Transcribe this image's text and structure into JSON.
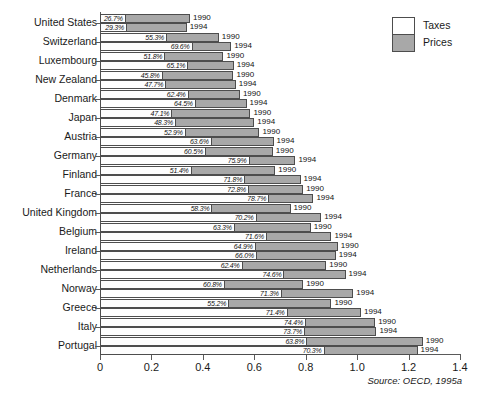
{
  "chart_data": {
    "type": "bar",
    "orientation": "horizontal",
    "stacked": true,
    "title": "",
    "subtitle": "",
    "xlabel": "",
    "ylabel": "",
    "xlim": [
      0,
      1.4
    ],
    "xticks": [
      "0",
      "0.2",
      "0.4",
      "0.6",
      "0.8",
      "1.0",
      "1.2",
      "1.4"
    ],
    "xtick_values": [
      0,
      0.2,
      0.4,
      0.6,
      0.8,
      1.0,
      1.2,
      1.4
    ],
    "grid": false,
    "legend_position": "top-right",
    "legend": [
      {
        "label": "Taxes",
        "color": "#ffffff"
      },
      {
        "label": "Prices",
        "color": "#a8a8a8"
      }
    ],
    "categories": [
      "United States",
      "Switzerland",
      "Luxembourg",
      "New Zealand",
      "Denmark",
      "Japan",
      "Austria",
      "Germany",
      "Finland",
      "France",
      "United Kingdom",
      "Belgium",
      "Ireland",
      "Netherlands",
      "Norway",
      "Greece",
      "Italy",
      "Portugal"
    ],
    "source": "Source: OECD, 1995a",
    "source_prefix": "Source:",
    "source_rest": " OECD, 1995a",
    "bars": [
      {
        "country": "United States",
        "year": "1990",
        "total": 0.35,
        "tax_share_pct": "26.7%",
        "tax_share": 0.267
      },
      {
        "country": "United States",
        "year": "1994",
        "total": 0.337,
        "tax_share_pct": "29.3%",
        "tax_share": 0.293
      },
      {
        "country": "Switzerland",
        "year": "1990",
        "total": 0.462,
        "tax_share_pct": "55.3%",
        "tax_share": 0.553
      },
      {
        "country": "Switzerland",
        "year": "1994",
        "total": 0.51,
        "tax_share_pct": "69.6%",
        "tax_share": 0.696
      },
      {
        "country": "Luxembourg",
        "year": "1990",
        "total": 0.48,
        "tax_share_pct": "51.8%",
        "tax_share": 0.518
      },
      {
        "country": "Luxembourg",
        "year": "1994",
        "total": 0.52,
        "tax_share_pct": "65.1%",
        "tax_share": 0.651
      },
      {
        "country": "New Zealand",
        "year": "1990",
        "total": 0.519,
        "tax_share_pct": "45.8%",
        "tax_share": 0.458
      },
      {
        "country": "New Zealand",
        "year": "1994",
        "total": 0.528,
        "tax_share_pct": "47.7%",
        "tax_share": 0.477
      },
      {
        "country": "Denmark",
        "year": "1990",
        "total": 0.544,
        "tax_share_pct": "62.4%",
        "tax_share": 0.624
      },
      {
        "country": "Denmark",
        "year": "1994",
        "total": 0.57,
        "tax_share_pct": "64.5%",
        "tax_share": 0.645
      },
      {
        "country": "Japan",
        "year": "1990",
        "total": 0.585,
        "tax_share_pct": "47.1%",
        "tax_share": 0.471
      },
      {
        "country": "Japan",
        "year": "1994",
        "total": 0.6,
        "tax_share_pct": "48.3%",
        "tax_share": 0.483
      },
      {
        "country": "Austria",
        "year": "1990",
        "total": 0.62,
        "tax_share_pct": "52.9%",
        "tax_share": 0.529
      },
      {
        "country": "Austria",
        "year": "1994",
        "total": 0.675,
        "tax_share_pct": "63.6%",
        "tax_share": 0.636
      },
      {
        "country": "Germany",
        "year": "1990",
        "total": 0.672,
        "tax_share_pct": "60.5%",
        "tax_share": 0.605
      },
      {
        "country": "Germany",
        "year": "1994",
        "total": 0.76,
        "tax_share_pct": "75.9%",
        "tax_share": 0.759
      },
      {
        "country": "Finland",
        "year": "1990",
        "total": 0.682,
        "tax_share_pct": "51.4%",
        "tax_share": 0.514
      },
      {
        "country": "Finland",
        "year": "1994",
        "total": 0.78,
        "tax_share_pct": "71.8%",
        "tax_share": 0.718
      },
      {
        "country": "France",
        "year": "1990",
        "total": 0.79,
        "tax_share_pct": "72.8%",
        "tax_share": 0.728
      },
      {
        "country": "France",
        "year": "1994",
        "total": 0.83,
        "tax_share_pct": "78.7%",
        "tax_share": 0.787
      },
      {
        "country": "United Kingdom",
        "year": "1990",
        "total": 0.741,
        "tax_share_pct": "58.3%",
        "tax_share": 0.583
      },
      {
        "country": "United Kingdom",
        "year": "1994",
        "total": 0.86,
        "tax_share_pct": "70.2%",
        "tax_share": 0.702
      },
      {
        "country": "Belgium",
        "year": "1990",
        "total": 0.82,
        "tax_share_pct": "63.3%",
        "tax_share": 0.633
      },
      {
        "country": "Belgium",
        "year": "1994",
        "total": 0.9,
        "tax_share_pct": "71.6%",
        "tax_share": 0.716
      },
      {
        "country": "Ireland",
        "year": "1990",
        "total": 0.925,
        "tax_share_pct": "64.9%",
        "tax_share": 0.649
      },
      {
        "country": "Ireland",
        "year": "1994",
        "total": 0.917,
        "tax_share_pct": "66.0%",
        "tax_share": 0.66
      },
      {
        "country": "Netherlands",
        "year": "1990",
        "total": 0.88,
        "tax_share_pct": "62.4%",
        "tax_share": 0.624
      },
      {
        "country": "Netherlands",
        "year": "1994",
        "total": 0.955,
        "tax_share_pct": "74.6%",
        "tax_share": 0.746
      },
      {
        "country": "Norway",
        "year": "1990",
        "total": 0.79,
        "tax_share_pct": "60.8%",
        "tax_share": 0.608
      },
      {
        "country": "Norway",
        "year": "1994",
        "total": 0.985,
        "tax_share_pct": "71.3%",
        "tax_share": 0.713
      },
      {
        "country": "Greece",
        "year": "1990",
        "total": 0.9,
        "tax_share_pct": "55.2%",
        "tax_share": 0.552
      },
      {
        "country": "Greece",
        "year": "1994",
        "total": 1.015,
        "tax_share_pct": "71.4%",
        "tax_share": 0.714
      },
      {
        "country": "Italy",
        "year": "1990",
        "total": 1.07,
        "tax_share_pct": "74.4%",
        "tax_share": 0.744
      },
      {
        "country": "Italy",
        "year": "1994",
        "total": 1.075,
        "tax_share_pct": "73.7%",
        "tax_share": 0.737
      },
      {
        "country": "Portugal",
        "year": "1990",
        "total": 1.255,
        "tax_share_pct": "63.8%",
        "tax_share": 0.638
      },
      {
        "country": "Portugal",
        "year": "1994",
        "total": 1.235,
        "tax_share_pct": "70.3%",
        "tax_share": 0.703
      }
    ]
  },
  "colors": {
    "taxes": "#ffffff",
    "prices": "#a8a8a8",
    "outline": "#4d4d4d",
    "axis": "#5a5a5a",
    "text": "#1a1a1a"
  }
}
